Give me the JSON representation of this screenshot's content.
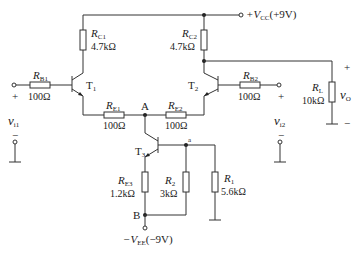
{
  "supply": {
    "vcc_label": "+V",
    "vcc_sub": "CC",
    "vcc_value": "(+9V)",
    "vee_label": "−V",
    "vee_sub": "EE",
    "vee_value": "(−9V)"
  },
  "resistors": {
    "rc1": {
      "name": "R",
      "sub": "C1",
      "value": "4.7kΩ"
    },
    "rc2": {
      "name": "R",
      "sub": "C2",
      "value": "4.7kΩ"
    },
    "rb1": {
      "name": "R",
      "sub": "B1",
      "value": "100Ω"
    },
    "rb2": {
      "name": "R",
      "sub": "B2",
      "value": "100Ω"
    },
    "re1": {
      "name": "R",
      "sub": "E1",
      "value": "100Ω"
    },
    "re2": {
      "name": "R",
      "sub": "E2",
      "value": "100Ω"
    },
    "re3": {
      "name": "R",
      "sub": "E3",
      "value": "1.2kΩ"
    },
    "r2": {
      "name": "R",
      "sub": "2",
      "value": "3kΩ"
    },
    "r1": {
      "name": "R",
      "sub": "1",
      "value": "5.6kΩ"
    },
    "rl": {
      "name": "R",
      "sub": "L",
      "value": "10kΩ"
    }
  },
  "transistors": {
    "t1": {
      "name": "T",
      "sub": "1"
    },
    "t2": {
      "name": "T",
      "sub": "2"
    },
    "t3": {
      "name": "T",
      "sub": "3"
    }
  },
  "nodes": {
    "a": "A",
    "b": "B",
    "small_a": "a"
  },
  "signals": {
    "vi1": {
      "name": "v",
      "sub": "i1",
      "plus": "+",
      "minus": "−"
    },
    "vi2": {
      "name": "v",
      "sub": "i2",
      "plus": "+",
      "minus": "−"
    },
    "vo": {
      "name": "v",
      "sub": "O",
      "plus": "+",
      "minus": "−"
    }
  }
}
